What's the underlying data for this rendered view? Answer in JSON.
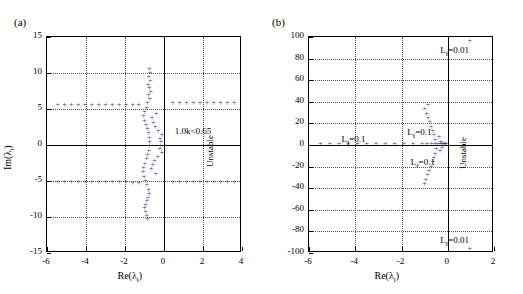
{
  "figure": {
    "panel_a_label": "(a)",
    "panel_b_label": "(b)"
  },
  "chart_data": [
    {
      "type": "scatter",
      "panel": "(a)",
      "title": "",
      "xlabel": "Re(λᵢ)",
      "ylabel": "Im(λᵢ)",
      "xlim": [
        -6,
        4
      ],
      "ylim": [
        -15,
        15
      ],
      "xticks": [
        -6,
        -4,
        -2,
        0,
        2,
        4
      ],
      "yticks": [
        -15,
        -10,
        -5,
        0,
        5,
        10,
        15
      ],
      "grid": true,
      "marker": "+",
      "color": "#3a3a7a",
      "annotations": [
        {
          "text": "1.0<kₖ<0.65",
          "x": 0.55,
          "y": 2.0
        },
        {
          "text": "Unstable",
          "x": 2.1,
          "y": -3.0,
          "rotation": -90
        }
      ],
      "points": [
        [
          -5.45,
          5.6
        ],
        [
          -5.1,
          5.55
        ],
        [
          -4.75,
          5.5
        ],
        [
          -4.4,
          5.5
        ],
        [
          -4.05,
          5.5
        ],
        [
          -3.7,
          5.5
        ],
        [
          -3.35,
          5.5
        ],
        [
          -3.0,
          5.5
        ],
        [
          -2.65,
          5.5
        ],
        [
          -2.3,
          5.5
        ],
        [
          -1.95,
          5.5
        ],
        [
          -1.6,
          5.55
        ],
        [
          -1.3,
          5.6
        ],
        [
          -5.45,
          -5.2
        ],
        [
          -5.1,
          -5.2
        ],
        [
          -4.75,
          -5.2
        ],
        [
          -4.4,
          -5.2
        ],
        [
          -4.05,
          -5.2
        ],
        [
          -3.7,
          -5.2
        ],
        [
          -3.35,
          -5.2
        ],
        [
          -3.0,
          -5.2
        ],
        [
          -2.65,
          -5.2
        ],
        [
          -2.3,
          -5.2
        ],
        [
          -1.95,
          -5.2
        ],
        [
          -1.6,
          -5.25
        ],
        [
          -1.3,
          -5.3
        ],
        [
          0.45,
          5.8
        ],
        [
          0.8,
          5.8
        ],
        [
          1.15,
          5.8
        ],
        [
          1.5,
          5.8
        ],
        [
          1.85,
          5.8
        ],
        [
          2.2,
          5.8
        ],
        [
          2.55,
          5.8
        ],
        [
          2.9,
          5.8
        ],
        [
          3.25,
          5.8
        ],
        [
          3.6,
          5.85
        ],
        [
          0.45,
          -5.1
        ],
        [
          0.8,
          -5.1
        ],
        [
          1.15,
          -5.1
        ],
        [
          1.5,
          -5.1
        ],
        [
          1.85,
          -5.1
        ],
        [
          2.2,
          -5.1
        ],
        [
          2.55,
          -5.1
        ],
        [
          2.9,
          -5.1
        ],
        [
          3.25,
          -5.1
        ],
        [
          3.6,
          -5.1
        ],
        [
          -0.75,
          10.5
        ],
        [
          -0.72,
          10.0
        ],
        [
          -0.78,
          9.4
        ],
        [
          -0.7,
          8.9
        ],
        [
          -0.82,
          8.4
        ],
        [
          -0.75,
          7.9
        ],
        [
          -0.68,
          7.4
        ],
        [
          -0.8,
          6.9
        ],
        [
          -0.73,
          6.4
        ],
        [
          -0.85,
          5.9
        ],
        [
          -0.9,
          5.2
        ],
        [
          -1.0,
          4.6
        ],
        [
          -1.05,
          4.0
        ],
        [
          -1.0,
          3.4
        ],
        [
          -0.92,
          2.8
        ],
        [
          -0.85,
          2.2
        ],
        [
          -0.8,
          1.6
        ],
        [
          -0.76,
          1.0
        ],
        [
          -0.74,
          0.4
        ],
        [
          -0.74,
          -0.2
        ],
        [
          -0.78,
          -0.8
        ],
        [
          -0.84,
          -1.4
        ],
        [
          -0.9,
          -2.0
        ],
        [
          -0.98,
          -2.6
        ],
        [
          -1.05,
          -3.2
        ],
        [
          -1.08,
          -3.8
        ],
        [
          -1.02,
          -4.4
        ],
        [
          -0.95,
          -5.0
        ],
        [
          -0.88,
          -5.6
        ],
        [
          -0.8,
          -6.2
        ],
        [
          -0.75,
          -6.8
        ],
        [
          -0.82,
          -7.3
        ],
        [
          -0.88,
          -7.8
        ],
        [
          -0.95,
          -8.3
        ],
        [
          -1.0,
          -8.8
        ],
        [
          -0.95,
          -9.3
        ],
        [
          -0.88,
          -9.8
        ],
        [
          -0.85,
          -10.3
        ],
        [
          -0.2,
          0.9
        ],
        [
          -0.15,
          0.4
        ],
        [
          -0.18,
          -0.1
        ],
        [
          -0.22,
          -0.6
        ],
        [
          -0.1,
          1.4
        ],
        [
          -0.12,
          -1.1
        ],
        [
          -0.3,
          1.9
        ],
        [
          -0.32,
          -1.6
        ],
        [
          -0.45,
          2.5
        ],
        [
          -0.48,
          -2.2
        ],
        [
          -0.55,
          3.1
        ],
        [
          -0.58,
          -2.8
        ],
        [
          -0.62,
          3.7
        ],
        [
          -0.65,
          -3.4
        ],
        [
          -0.4,
          4.3
        ],
        [
          -0.42,
          -4.0
        ]
      ]
    },
    {
      "type": "scatter",
      "panel": "(b)",
      "title": "",
      "xlabel": "Re(λᵢ)",
      "ylabel": "",
      "xlim": [
        -6,
        2
      ],
      "ylim": [
        -100,
        100
      ],
      "xticks": [
        -6,
        -4,
        -2,
        0,
        2
      ],
      "yticks": [
        -100,
        -80,
        -60,
        -40,
        -20,
        0,
        20,
        40,
        60,
        80,
        100
      ],
      "grid": true,
      "marker": "+",
      "color": "#3a3a7a",
      "annotations": [
        {
          "text": "Lғ=0.01",
          "x": 1.15,
          "y": 88
        },
        {
          "text": "Lғ=0.01",
          "x": 1.15,
          "y": -88
        },
        {
          "text": "Lғ=0.1",
          "x": -4.6,
          "y": 6
        },
        {
          "text": "Lғ=0.1",
          "x": -1.75,
          "y": 12
        },
        {
          "text": "Lғ=0.1",
          "x": -1.6,
          "y": -16
        },
        {
          "text": "Unstable",
          "x": 0.45,
          "y": -22,
          "rotation": -90
        }
      ],
      "points": [
        [
          -5.5,
          1
        ],
        [
          -5.1,
          1
        ],
        [
          -4.7,
          1
        ],
        [
          -4.3,
          1
        ],
        [
          -3.9,
          1
        ],
        [
          -3.5,
          1
        ],
        [
          -3.1,
          1
        ],
        [
          -2.7,
          1
        ],
        [
          -2.3,
          1
        ],
        [
          -1.9,
          1
        ],
        [
          -1.5,
          1
        ],
        [
          -1.1,
          1
        ],
        [
          -0.9,
          1
        ],
        [
          -0.7,
          1
        ],
        [
          -0.55,
          1
        ],
        [
          -0.45,
          1
        ],
        [
          -0.35,
          1
        ],
        [
          -0.28,
          1
        ],
        [
          -0.22,
          1
        ],
        [
          -0.17,
          1
        ],
        [
          -0.13,
          1
        ],
        [
          -0.1,
          1
        ],
        [
          -0.08,
          1
        ],
        [
          -0.55,
          5
        ],
        [
          -0.6,
          9
        ],
        [
          -0.65,
          13
        ],
        [
          -0.72,
          17
        ],
        [
          -0.78,
          21
        ],
        [
          -0.85,
          25
        ],
        [
          -0.92,
          29
        ],
        [
          -1.0,
          33
        ],
        [
          -0.85,
          37
        ],
        [
          -0.5,
          -4
        ],
        [
          -0.55,
          -8
        ],
        [
          -0.6,
          -12
        ],
        [
          -0.65,
          -16
        ],
        [
          -0.72,
          -20
        ],
        [
          -0.8,
          -24
        ],
        [
          -0.88,
          -28
        ],
        [
          -0.95,
          -32
        ],
        [
          -1.0,
          -36
        ],
        [
          -0.3,
          3
        ],
        [
          -0.25,
          -3
        ],
        [
          -0.38,
          7
        ],
        [
          -0.33,
          -6
        ],
        [
          0.95,
          96
        ],
        [
          0.95,
          -96
        ]
      ]
    }
  ]
}
